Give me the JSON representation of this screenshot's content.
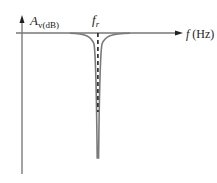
{
  "diagram": {
    "y_axis_label": {
      "main": "A",
      "sub": "v(dB)"
    },
    "x_axis_label": {
      "main": "f",
      "unit": " (Hz)"
    },
    "center_label": {
      "main": "f",
      "sub": "r"
    },
    "curve_type": "notch",
    "colors": {
      "axis": "#555555",
      "curve": "#7a7a7a",
      "dashed": "#222222"
    }
  }
}
